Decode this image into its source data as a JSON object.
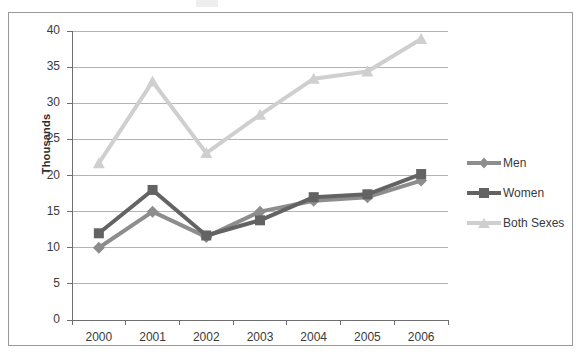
{
  "chart_data": {
    "type": "line",
    "title": "",
    "xlabel": "",
    "ylabel": "Thousands",
    "categories": [
      "2000",
      "2001",
      "2002",
      "2003",
      "2004",
      "2005",
      "2006"
    ],
    "ylim": [
      0,
      40
    ],
    "ytick_values": [
      0,
      5,
      10,
      15,
      20,
      25,
      30,
      35,
      40
    ],
    "ytick_labels": [
      "0",
      "5",
      "10",
      "15",
      "20",
      "25",
      "30",
      "35",
      "40"
    ],
    "grid": "horizontal",
    "legend_position": "right",
    "series": [
      {
        "name": "Men",
        "color": "#8d8d8d",
        "marker": "diamond",
        "values": [
          10.0,
          15.0,
          11.5,
          15.0,
          16.5,
          17.0,
          19.3
        ]
      },
      {
        "name": "Women",
        "color": "#636363",
        "marker": "square",
        "values": [
          12.0,
          18.0,
          11.7,
          13.8,
          17.0,
          17.4,
          20.2
        ]
      },
      {
        "name": "Both Sexes",
        "color": "#cfcfcf",
        "marker": "triangle",
        "values": [
          21.7,
          33.0,
          23.1,
          28.4,
          33.4,
          34.4,
          38.9
        ]
      }
    ]
  },
  "axis": {
    "y_title": "Thousands"
  },
  "legend": {
    "items": [
      {
        "label": "Men"
      },
      {
        "label": "Women"
      },
      {
        "label": "Both Sexes"
      }
    ]
  },
  "colors": {
    "men": "#8d8d8d",
    "women": "#636363",
    "both_sexes": "#cfcfcf",
    "gridline": "#b4b4b4",
    "axis": "#6e6e6e",
    "frame": "#9a9a9a",
    "text": "#3a3a3a"
  }
}
